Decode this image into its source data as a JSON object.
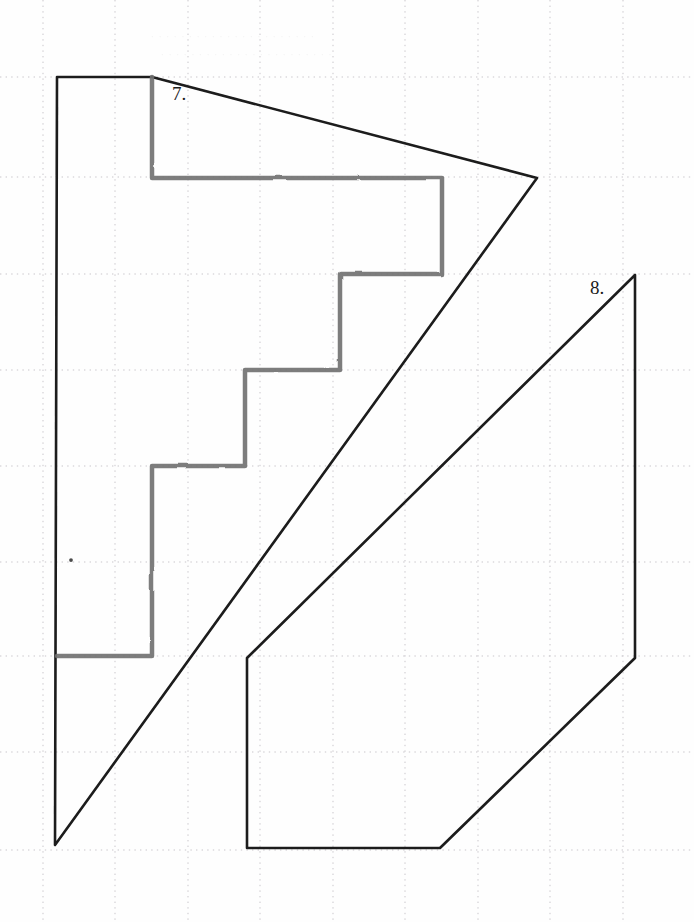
{
  "page": {
    "width": 694,
    "height": 922,
    "background_color": "#fefefe",
    "medium": "graph-paper-scan"
  },
  "grid": {
    "visible": true,
    "style": "dotted",
    "color": "#c9c6cb",
    "x_lines": [
      43,
      115,
      188,
      260,
      333,
      405,
      478,
      550,
      623
    ],
    "y_lines": [
      77,
      177,
      274,
      370,
      466,
      562,
      656,
      752,
      850
    ],
    "x_spacing": 72.5,
    "y_spacing": 96.5
  },
  "labels": {
    "figure_7": "7.",
    "figure_8": "8."
  },
  "bleed_through": {
    "note": "faint reversed show-through text from the back of the sheet, illegible",
    "lines": [
      "· · · ·   · · · ·   · · ·   · · · · ·   · · · ·   · ·",
      "· · ·   · · ·   · · · · ·   · · ·   · · · · ·   · · · ·"
    ]
  },
  "colors": {
    "ink_black": "#1b1b1b",
    "marker_gray": "#6f6f6f",
    "marker_gray_light": "#8d8d8d",
    "grid_gray": "#c9c6cb",
    "paper": "#fefefe"
  },
  "chart_data": {
    "type": "scatter",
    "xlabel": "",
    "ylabel": "",
    "grid": true,
    "legend": "none",
    "xlim": [
      0,
      694
    ],
    "ylim": [
      922,
      0
    ],
    "annotations": [
      {
        "text": "7.",
        "x": 175,
        "y": 95
      },
      {
        "text": "8.",
        "x": 600,
        "y": 288
      }
    ],
    "series": [
      {
        "name": "figure-7-outline",
        "kind": "polygon",
        "color": "#1b1b1b",
        "stroke_width": 2.6,
        "closed": true,
        "points": [
          [
            57,
            77
          ],
          [
            152,
            77
          ],
          [
            537,
            178
          ],
          [
            55,
            845
          ]
        ]
      },
      {
        "name": "figure-8-outline",
        "kind": "polygon",
        "color": "#1b1b1b",
        "stroke_width": 2.6,
        "closed": true,
        "points": [
          [
            635,
            275
          ],
          [
            635,
            658
          ],
          [
            440,
            848
          ],
          [
            247,
            848
          ],
          [
            247,
            658
          ]
        ]
      },
      {
        "name": "gray-staircase",
        "kind": "polyline",
        "color": "#6f6f6f",
        "stroke_width": 4.5,
        "closed": false,
        "points": [
          [
            57,
            656
          ],
          [
            152,
            656
          ],
          [
            152,
            466
          ],
          [
            245,
            466
          ],
          [
            245,
            370
          ],
          [
            340,
            370
          ],
          [
            340,
            274
          ],
          [
            442,
            274
          ],
          [
            442,
            178
          ],
          [
            152,
            178
          ],
          [
            152,
            77
          ]
        ]
      },
      {
        "name": "gray-tick-mid",
        "kind": "polyline",
        "color": "#6f6f6f",
        "stroke_width": 3.4,
        "closed": false,
        "points": [
          [
            152,
            562
          ],
          [
            205,
            562
          ]
        ]
      },
      {
        "name": "gray-tick-lower",
        "kind": "polyline",
        "color": "#6f6f6f",
        "stroke_width": 3.4,
        "closed": false,
        "points": [
          [
            57,
            752
          ],
          [
            105,
            752
          ]
        ]
      },
      {
        "name": "gray-dot-left",
        "kind": "point",
        "color": "#4a4a4a",
        "stroke_width": 3.0,
        "points": [
          [
            71,
            560
          ]
        ]
      }
    ]
  }
}
